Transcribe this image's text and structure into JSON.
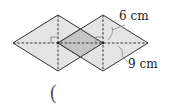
{
  "figure": {
    "labels": {
      "top_dimension": "6 cm",
      "bottom_dimension": "9 cm"
    },
    "answer_blank": "(",
    "colors": {
      "rhombus_fill": "#e4e4e4",
      "overlap_fill": "#c4c4c4",
      "outline": "#333333",
      "dashed_line": "#333333"
    }
  }
}
